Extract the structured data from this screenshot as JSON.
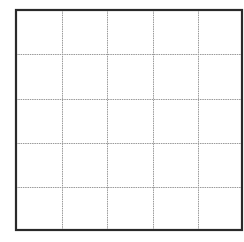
{
  "grid": {
    "rows": 5,
    "cols": 5,
    "border_color": "#2a2a2a",
    "line_color": "#9a9a9a",
    "background": "#ffffff",
    "x_edges": [
      16,
      62,
      107,
      153,
      198,
      242
    ],
    "y_edges": [
      10,
      54,
      99,
      143,
      187,
      230
    ],
    "border_width": 2.2,
    "line_width": 1
  }
}
